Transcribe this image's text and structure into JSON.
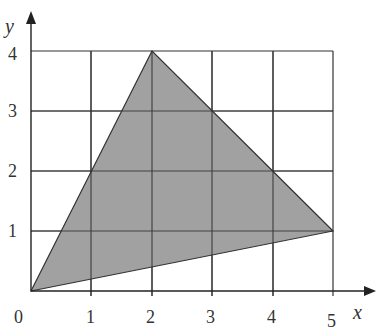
{
  "diagram": {
    "type": "coordinate-grid-triangle",
    "x_axis": {
      "label": "x",
      "ticks": [
        "0",
        "1",
        "2",
        "3",
        "4",
        "5"
      ]
    },
    "y_axis": {
      "label": "y",
      "ticks": [
        "1",
        "2",
        "3",
        "4"
      ]
    },
    "triangle": {
      "vertices": [
        [
          0,
          0
        ],
        [
          2,
          4
        ],
        [
          5,
          1
        ]
      ],
      "fill": "#9c9c9c",
      "stroke": "#333333"
    },
    "grid_color": "#333333",
    "top_text_fragment": "p                y"
  }
}
